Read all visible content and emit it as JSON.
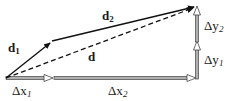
{
  "diagram": {
    "vectors": {
      "d1": {
        "label": "d",
        "sub": "1",
        "from": [
          6,
          78
        ],
        "to": [
          52,
          41
        ],
        "style": "solid"
      },
      "d2": {
        "label": "d",
        "sub": "2",
        "from": [
          52,
          41
        ],
        "to": [
          197,
          6
        ],
        "style": "solid"
      },
      "d": {
        "label": "d",
        "from": [
          6,
          78
        ],
        "to": [
          197,
          6
        ],
        "style": "dashed"
      }
    },
    "components": {
      "dx1": {
        "label": "Δx",
        "sub": "1",
        "from": [
          6,
          78
        ],
        "to": [
          54,
          78
        ]
      },
      "dx2": {
        "label": "Δx",
        "sub": "2",
        "from": [
          54,
          78
        ],
        "to": [
          197,
          78
        ]
      },
      "dy1": {
        "label": "Δy",
        "sub": "1",
        "from": [
          197,
          78
        ],
        "to": [
          197,
          42
        ]
      },
      "dy2": {
        "label": "Δy",
        "sub": "2",
        "from": [
          197,
          42
        ],
        "to": [
          197,
          6
        ]
      }
    },
    "colors": {
      "vector": "#111111",
      "component_outline": "#444444",
      "component_fill": "#b0b0b0"
    }
  }
}
